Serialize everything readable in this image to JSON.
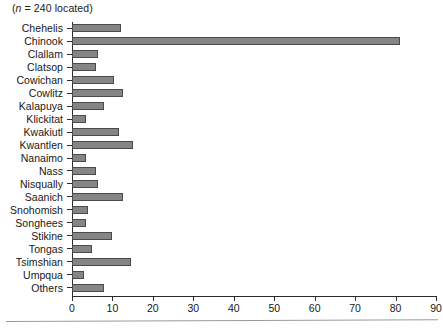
{
  "note": {
    "prefix": "(",
    "italic_symbol": "n",
    "rest": " = 240 located)"
  },
  "chart_data": {
    "type": "bar",
    "orientation": "horizontal",
    "title": "",
    "subtitle": "(n = 240 located)",
    "xlabel": "",
    "ylabel": "",
    "xlim": [
      0,
      90
    ],
    "xticks": [
      0,
      10,
      20,
      30,
      40,
      50,
      60,
      70,
      80,
      90
    ],
    "grid": false,
    "legend": false,
    "bar_color": "#858585",
    "bar_edge_color": "#4a4a4a",
    "axis_color": "#2b2b2b",
    "categories": [
      "Chehelis",
      "Chinook",
      "Clallam",
      "Clatsop",
      "Cowichan",
      "Cowlitz",
      "Kalapuya",
      "Klickitat",
      "Kwakiutl",
      "Kwantlen",
      "Nanaimo",
      "Nass",
      "Nisqually",
      "Saanich",
      "Snohomish",
      "Songhees",
      "Stikine",
      "Tongas",
      "Tsimshian",
      "Umpqua",
      "Others"
    ],
    "values": [
      12,
      81,
      6.5,
      6,
      10.5,
      12.5,
      8,
      3.5,
      11.5,
      15,
      3.5,
      6,
      6.5,
      12.5,
      4,
      3.5,
      10,
      5,
      14.5,
      3,
      8
    ]
  }
}
